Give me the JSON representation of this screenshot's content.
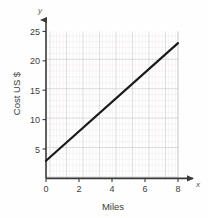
{
  "chart_data": {
    "type": "line",
    "title": "",
    "subtitle": "",
    "xlabel": "Miles",
    "ylabel": "Cost US $",
    "x_axis_letter": "x",
    "y_axis_letter": "y",
    "xlim": [
      0,
      8.4
    ],
    "ylim": [
      0,
      25.6
    ],
    "xticks": [
      0,
      2,
      4,
      6,
      8
    ],
    "xtick_labels": [
      "0",
      "2",
      "4",
      "6",
      "8"
    ],
    "yticks": [
      5,
      10,
      15,
      20,
      25
    ],
    "ytick_labels": [
      "5",
      "10",
      "15",
      "20",
      "25"
    ],
    "grid": true,
    "grid_major_x_step": 1,
    "grid_major_y_step": 5,
    "grid_minor_subdivisions": 5,
    "legend": null,
    "legend_position": "none",
    "series": [
      {
        "name": "Cost",
        "type": "line",
        "color": "#1a1a1a",
        "line_width": 2.2,
        "intercept": 3,
        "slope": 2.5,
        "x": [
          0,
          8
        ],
        "values": [
          3,
          23
        ],
        "points": [
          [
            0,
            3
          ],
          [
            1,
            5.5
          ],
          [
            2,
            8
          ],
          [
            3,
            10.5
          ],
          [
            4,
            13
          ],
          [
            5,
            15.5
          ],
          [
            6,
            18
          ],
          [
            7,
            20.5
          ],
          [
            8,
            23
          ]
        ]
      }
    ],
    "colors": {
      "axis": "#3a3a3a",
      "line": "#1a1a1a",
      "grid_major": "#b8b8c0",
      "grid_minor": "#e4dcdc",
      "background": "#fefefe",
      "text": "#3d3d3d"
    }
  }
}
